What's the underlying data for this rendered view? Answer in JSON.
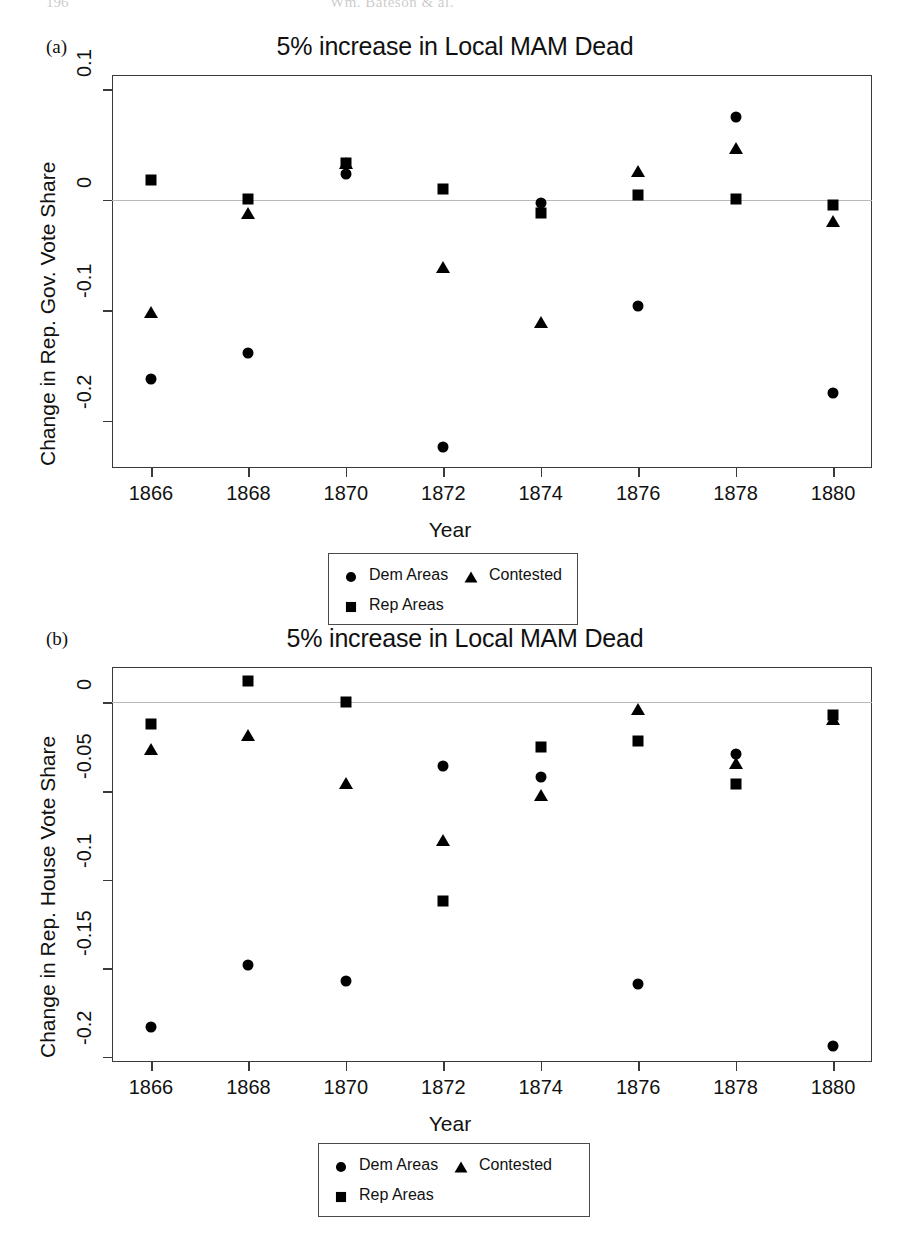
{
  "page_header": {
    "folio": "196",
    "running_title": "Wm. Bateson & al."
  },
  "legend": {
    "entries": [
      {
        "label": "Dem Areas",
        "marker": "circle",
        "icon": "circle-marker-icon"
      },
      {
        "label": "Contested",
        "marker": "triangle",
        "icon": "triangle-marker-icon"
      },
      {
        "label": "Rep Areas",
        "marker": "square",
        "icon": "square-marker-icon"
      }
    ]
  },
  "panels": [
    {
      "id": "a",
      "panel_label": "(a)",
      "title": "5% increase in Local MAM Dead",
      "xlabel": "Year",
      "ylabel": "Change in Rep. Gov. Vote Share",
      "yticks": [
        "0.1",
        "0",
        "-0.1",
        "-0.2"
      ],
      "xticks": [
        "1866",
        "1868",
        "1870",
        "1872",
        "1874",
        "1876",
        "1878",
        "1880"
      ]
    },
    {
      "id": "b",
      "panel_label": "(b)",
      "title": "5% increase in Local MAM Dead",
      "xlabel": "Year",
      "ylabel": "Change in Rep. House Vote Share",
      "yticks": [
        "0",
        "-0.05",
        "-0.1",
        "-0.15",
        "-0.2"
      ],
      "xticks": [
        "1866",
        "1868",
        "1870",
        "1872",
        "1874",
        "1876",
        "1878",
        "1880"
      ]
    }
  ],
  "chart_data": [
    {
      "type": "scatter",
      "panel": "a",
      "title": "5% increase in Local MAM Dead",
      "xlabel": "Year",
      "ylabel": "Change in Rep. Gov. Vote Share",
      "x": [
        1866,
        1868,
        1870,
        1872,
        1874,
        1876,
        1878,
        1880
      ],
      "xlim": [
        1865.2,
        1880.8
      ],
      "ylim": [
        -0.243,
        0.113
      ],
      "yticks": [
        0.1,
        0,
        -0.1,
        -0.2
      ],
      "grid": false,
      "zero_line": true,
      "legend_position": "below",
      "series": [
        {
          "name": "Dem Areas",
          "marker": "circle",
          "values": [
            -0.162,
            -0.139,
            0.023,
            -0.224,
            -0.003,
            -0.096,
            0.075,
            -0.175
          ]
        },
        {
          "name": "Contested",
          "marker": "triangle",
          "values": [
            -0.103,
            -0.013,
            0.032,
            -0.062,
            -0.112,
            0.025,
            0.046,
            -0.02
          ]
        },
        {
          "name": "Rep Areas",
          "marker": "square",
          "values": [
            0.018,
            0.001,
            0.033,
            0.01,
            -0.012,
            0.004,
            0.001,
            -0.005
          ]
        }
      ]
    },
    {
      "type": "scatter",
      "panel": "b",
      "title": "5% increase in Local MAM Dead",
      "xlabel": "Year",
      "ylabel": "Change in Rep. House Vote Share",
      "x": [
        1866,
        1868,
        1870,
        1872,
        1874,
        1876,
        1878,
        1880
      ],
      "xlim": [
        1865.2,
        1880.8
      ],
      "ylim": [
        -0.203,
        0.02
      ],
      "yticks": [
        0,
        -0.05,
        -0.1,
        -0.15,
        -0.2
      ],
      "grid": false,
      "zero_line": true,
      "legend_position": "below",
      "series": [
        {
          "name": "Dem Areas",
          "marker": "circle",
          "values": [
            -0.183,
            -0.148,
            -0.157,
            -0.036,
            -0.042,
            -0.159,
            -0.029,
            -0.194
          ]
        },
        {
          "name": "Contested",
          "marker": "triangle",
          "values": [
            -0.027,
            -0.019,
            -0.046,
            -0.078,
            -0.053,
            -0.004,
            -0.035,
            -0.01
          ]
        },
        {
          "name": "Rep Areas",
          "marker": "square",
          "values": [
            -0.012,
            0.012,
            0.0,
            -0.112,
            -0.025,
            -0.022,
            -0.046,
            -0.007
          ]
        }
      ]
    }
  ]
}
